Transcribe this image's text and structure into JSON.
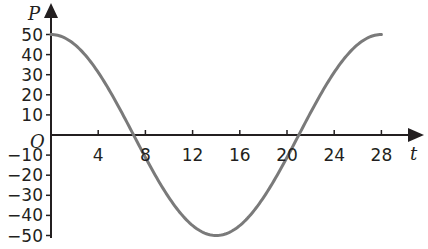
{
  "chart_data": {
    "type": "line",
    "title": "",
    "xlabel": "t",
    "ylabel": "P",
    "origin_label": "O",
    "function": "P = 50 cos(2πt / 28)",
    "xlim": [
      0,
      28
    ],
    "ylim": [
      -50,
      50
    ],
    "x_ticks": [
      4,
      8,
      12,
      16,
      20,
      24,
      28
    ],
    "x_tick_labels": [
      "4",
      "8",
      "12",
      "16",
      "20",
      "24",
      "28"
    ],
    "y_ticks": [
      50,
      40,
      30,
      20,
      10,
      -10,
      -20,
      -30,
      -40,
      -50
    ],
    "y_tick_labels": [
      "50",
      "40",
      "30",
      "20",
      "10",
      "−10",
      "−20",
      "−30",
      "−40",
      "−50"
    ],
    "grid": false,
    "legend": null,
    "series": [
      {
        "name": "P(t)",
        "color": "#7a7a7a",
        "x": [
          0,
          2,
          4,
          6,
          7,
          8,
          10,
          12,
          14,
          16,
          18,
          20,
          21,
          22,
          24,
          26,
          28
        ],
        "values": [
          50,
          45.0,
          31.2,
          11.1,
          0,
          -11.1,
          -31.2,
          -45.0,
          -50,
          -45.0,
          -31.2,
          -11.1,
          0,
          11.1,
          31.2,
          45.0,
          50
        ]
      }
    ],
    "key_points": {
      "max": [
        [
          0,
          50
        ],
        [
          28,
          50
        ]
      ],
      "min": [
        [
          14,
          -50
        ]
      ],
      "zeros": [
        7,
        21
      ]
    }
  },
  "colors": {
    "axis": "#231f20",
    "curve": "#7a7a7a",
    "background": "#ffffff"
  }
}
